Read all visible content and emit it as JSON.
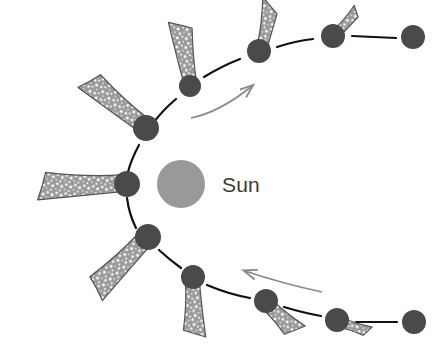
{
  "figure": {
    "kind": "diagram",
    "background_color": "#ffffff"
  },
  "sun": {
    "label": "Sun",
    "center": [
      181,
      184
    ],
    "radius": 24,
    "fill_color": "#999999",
    "label_position": [
      222,
      192
    ],
    "label_color": "#3b3b3b",
    "label_font_size": 21
  },
  "orbit": {
    "stroke_color": "#111111",
    "stroke_width": 2.2,
    "description": "elliptical orbit path drawn as segmented arcs between comet positions"
  },
  "comet_style": {
    "nucleus_fill": "#4a4a4a",
    "tail_outline": "#555555",
    "tail_fill": "#9a9a9a",
    "tail_speckle": "#ffffff"
  },
  "comets": [
    {
      "id": "c1",
      "label": "position-1",
      "nucleus": [
        413,
        37
      ],
      "radius": 12,
      "tail_length": 0,
      "tail_angle_deg": 0,
      "has_tail": false
    },
    {
      "id": "c2",
      "label": "position-2",
      "nucleus": [
        333,
        36
      ],
      "radius": 12,
      "tail_length": 30,
      "tail_angle_deg": 23,
      "has_tail": true
    },
    {
      "id": "c3",
      "label": "position-3",
      "nucleus": [
        259,
        51
      ],
      "radius": 12,
      "tail_length": 48,
      "tail_angle_deg": 42,
      "has_tail": true
    },
    {
      "id": "c4",
      "label": "position-4",
      "nucleus": [
        190,
        86
      ],
      "radius": 11,
      "tail_length": 66,
      "tail_angle_deg": 81,
      "has_tail": true
    },
    {
      "id": "c5",
      "label": "position-5",
      "nucleus": [
        146,
        128
      ],
      "radius": 13,
      "tail_length": 84,
      "tail_angle_deg": 133,
      "has_tail": true
    },
    {
      "id": "c6",
      "label": "position-6",
      "nucleus": [
        127,
        184
      ],
      "radius": 13,
      "tail_length": 96,
      "tail_angle_deg": 178,
      "has_tail": true
    },
    {
      "id": "c7",
      "label": "position-7",
      "nucleus": [
        148,
        237
      ],
      "radius": 13,
      "tail_length": 84,
      "tail_angle_deg": 221,
      "has_tail": true
    },
    {
      "id": "c8",
      "label": "position-8",
      "nucleus": [
        193,
        277
      ],
      "radius": 12,
      "tail_length": 62,
      "tail_angle_deg": 262,
      "has_tail": true
    },
    {
      "id": "c9",
      "label": "position-9",
      "nucleus": [
        266,
        301
      ],
      "radius": 12,
      "tail_length": 46,
      "tail_angle_deg": 302,
      "has_tail": true
    },
    {
      "id": "c10",
      "label": "position-10",
      "nucleus": [
        337,
        320
      ],
      "radius": 12,
      "tail_length": 34,
      "tail_angle_deg": 320,
      "has_tail": true
    },
    {
      "id": "c11",
      "label": "position-11",
      "nucleus": [
        414,
        322
      ],
      "radius": 12,
      "tail_length": 0,
      "tail_angle_deg": 0,
      "has_tail": false
    }
  ],
  "direction_arrows": [
    {
      "id": "arrow-upper",
      "label": "orbital-direction-arrow-upper",
      "points_toward": "upper-right",
      "color": "#8a8a8a",
      "start": [
        191,
        118
      ],
      "end": [
        256,
        84
      ]
    },
    {
      "id": "arrow-lower",
      "label": "orbital-direction-arrow-lower",
      "points_toward": "upper-left",
      "color": "#8a8a8a",
      "start": [
        322,
        292
      ],
      "end": [
        241,
        270
      ]
    }
  ],
  "orbit_segments": [
    "393,38 to 352,36",
    "314,38 to 278,45",
    "241,57 to 206,74",
    "176,96 to 155,115",
    "139,142 to 130,170",
    "128,198 to 136,224",
    "158,249 to 180,266",
    "207,284 to 248,297",
    "284,306 to 320,316",
    "355,322 to 396,322"
  ]
}
